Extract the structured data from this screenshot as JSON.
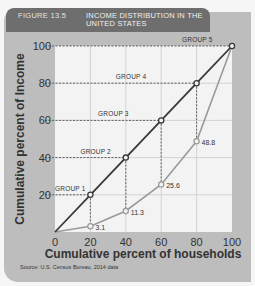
{
  "figure": {
    "number": "FIGURE 13.5",
    "title": "INCOME DISTRIBUTION IN THE UNITED STATES",
    "source": "Source: U.S. Census Bureau, 2014 data"
  },
  "colors": {
    "equality_line": "#3a3a3a",
    "lorenz_curve": "#9a9a9a",
    "plot_bg": "#f3f3f3",
    "panel_bg": "#bdbdbd",
    "header_bg": "#6e6e6e",
    "grid": "#d2d2d2"
  },
  "chart_data": {
    "type": "line",
    "title": "Income Distribution in the United States",
    "xlabel": "Cumulative percent of households",
    "ylabel": "Cumulative percent of Income",
    "xlim": [
      0,
      100
    ],
    "ylim": [
      0,
      100
    ],
    "x_ticks": [
      "0",
      "20",
      "40",
      "60",
      "80",
      "100"
    ],
    "y_ticks": [
      "20",
      "40",
      "60",
      "80",
      "100"
    ],
    "grid": true,
    "x": [
      0,
      20,
      40,
      60,
      80,
      100
    ],
    "series": [
      {
        "name": "Line of perfect equality",
        "values": [
          0,
          20,
          40,
          60,
          80,
          100
        ],
        "group_labels": [
          "GROUP 1",
          "GROUP 2",
          "GROUP 3",
          "GROUP 4",
          "GROUP 5"
        ]
      },
      {
        "name": "Actual distribution (Lorenz curve)",
        "values": [
          0,
          3.1,
          11.3,
          25.6,
          48.8,
          100
        ],
        "data_labels": [
          "3.1",
          "11.3",
          "25.6",
          "48.8"
        ]
      }
    ],
    "annotations": [
      "GROUP 1",
      "GROUP 2",
      "GROUP 3",
      "GROUP 4",
      "GROUP 5",
      "3.1",
      "11.3",
      "25.6",
      "48.8"
    ]
  }
}
